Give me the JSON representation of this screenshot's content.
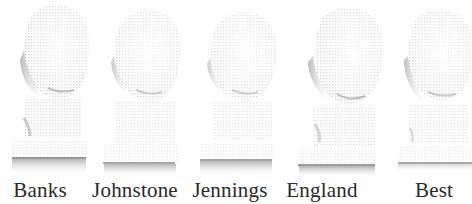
{
  "figure": {
    "busts": [
      {
        "name": "Banks",
        "label_x": 40,
        "left": 4,
        "width": 92,
        "base_y": 158
      },
      {
        "name": "Johnstone",
        "label_x": 135,
        "left": 98,
        "width": 92,
        "base_y": 163
      },
      {
        "name": "Jennings",
        "label_x": 230,
        "left": 196,
        "width": 92,
        "base_y": 160
      },
      {
        "name": "England",
        "label_x": 322,
        "left": 293,
        "width": 96,
        "base_y": 165
      },
      {
        "name": "Best",
        "label_x": 434,
        "left": 394,
        "width": 78,
        "base_y": 163
      }
    ],
    "colors": {
      "background": "#ffffff",
      "bust_light": "#e6e6e6",
      "bust_shadow": "#9a9a9a",
      "base_line": "#7a7a7a",
      "caption": "#2a2a2a"
    }
  }
}
